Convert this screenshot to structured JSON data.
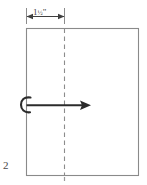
{
  "figure": {
    "number": "2",
    "dimension": {
      "whole": "1",
      "fraction": "½",
      "unit": "\"",
      "full_label": "1½\"",
      "position": "top"
    },
    "sheet": {
      "label": "paper-sheet",
      "outline_color": "#808080",
      "fill_color": "#ffffff"
    },
    "fold_line": {
      "label": "dashed-fold-line",
      "style": "dashed",
      "color": "#8c8c8c"
    },
    "fold_arrow": {
      "label": "fold-direction-arrow",
      "direction": "right",
      "color": "#2b2b2b",
      "has_curl": true
    },
    "bottom_tick": {
      "label": "bottom-center-tick",
      "color": "#9a9a9a"
    }
  }
}
